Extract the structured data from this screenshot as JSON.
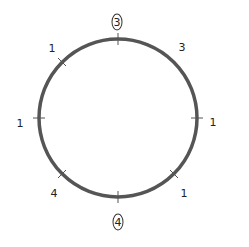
{
  "diagram": {
    "shape": "circle",
    "center": [
      118,
      118
    ],
    "radius": 80,
    "stroke_color": "#555555",
    "labels": [
      {
        "position": "top",
        "text": "3",
        "circled": true,
        "x": 117,
        "y": 22
      },
      {
        "position": "top-right",
        "text": "3",
        "circled": false,
        "x": 182,
        "y": 47
      },
      {
        "position": "right",
        "text": "1",
        "circled": false,
        "x": 213,
        "y": 122
      },
      {
        "position": "bottom-right",
        "text": "1",
        "circled": false,
        "x": 184,
        "y": 193
      },
      {
        "position": "bottom",
        "text": "4",
        "circled": true,
        "x": 118,
        "y": 222
      },
      {
        "position": "bottom-left",
        "text": "4",
        "circled": false,
        "x": 54,
        "y": 193
      },
      {
        "position": "left",
        "text": "1",
        "circled": false,
        "x": 20,
        "y": 123
      },
      {
        "position": "top-left",
        "text": "1",
        "circled": false,
        "x": 52,
        "y": 48
      }
    ]
  }
}
